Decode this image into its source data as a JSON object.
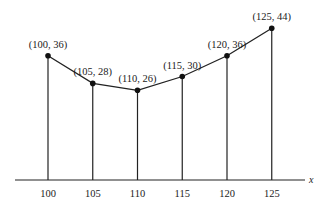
{
  "chart_data": {
    "type": "line",
    "title": "",
    "xlabel": "x",
    "ylabel": "",
    "x": [
      100,
      105,
      110,
      115,
      120,
      125
    ],
    "values": [
      36,
      28,
      26,
      30,
      36,
      44
    ],
    "point_labels": [
      "(100, 36)",
      "(105, 28)",
      "(110, 26)",
      "(115, 30)",
      "(120, 36)",
      "(125, 44)"
    ],
    "x_tick_labels": [
      "100",
      "105",
      "110",
      "115",
      "120",
      "125"
    ],
    "xlim": [
      97,
      128
    ],
    "ylim": [
      0,
      47
    ],
    "grid": false,
    "legend": null,
    "drop_lines": true,
    "markers": true,
    "colors": {
      "line": "#222222",
      "axis": "#222222"
    }
  }
}
